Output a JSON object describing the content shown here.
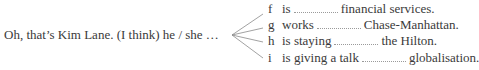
{
  "stem": "Oh, that’s Kim Lane. (I think) he / she …",
  "items": [
    {
      "letter": "f",
      "before": "is",
      "after": "financial services."
    },
    {
      "letter": "g",
      "before": "works",
      "after": "Chase-Manhattan."
    },
    {
      "letter": "h",
      "before": "is staying",
      "after": "the Hilton."
    },
    {
      "letter": "i",
      "before": "is giving a talk",
      "after": "globalisation."
    }
  ]
}
